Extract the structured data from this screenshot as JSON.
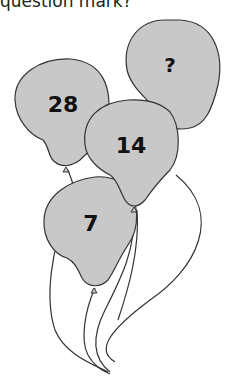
{
  "question_text": "question mark?",
  "balloons": [
    {
      "label": "?",
      "fill": "#c8c8c8"
    },
    {
      "label": "28",
      "fill": "#c8c8c8"
    },
    {
      "label": "14",
      "fill": "#c8c8c8"
    },
    {
      "label": "7",
      "fill": "#c8c8c8"
    }
  ],
  "colors": {
    "balloon_fill": "#c8c8c8",
    "outline": "#333333"
  }
}
